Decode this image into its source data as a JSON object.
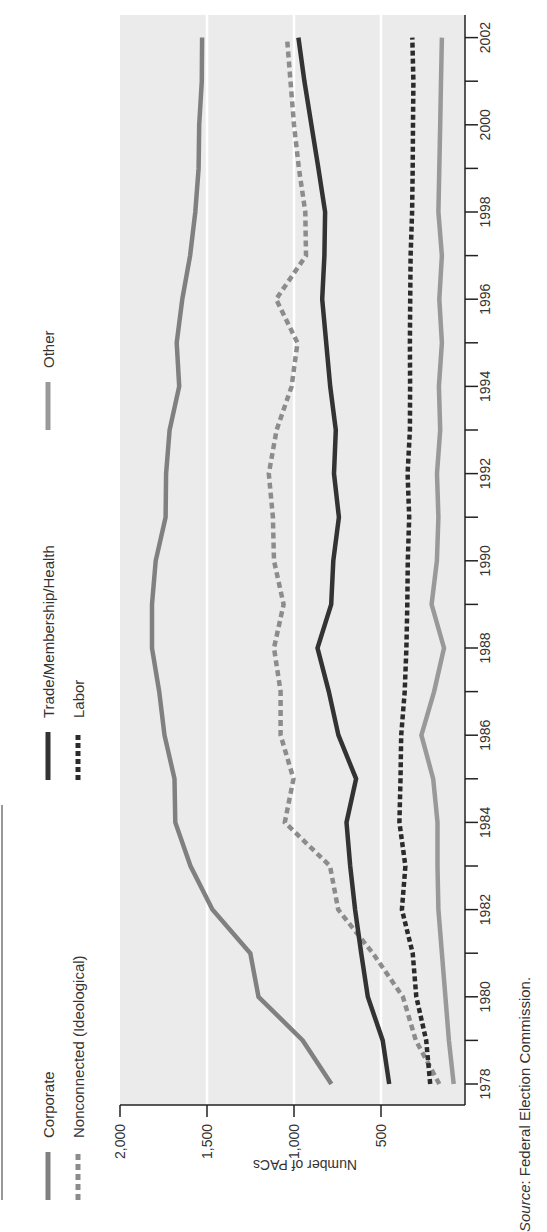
{
  "chart_data": {
    "type": "line",
    "orientation": "rotated-90-clockwise",
    "title": "",
    "xlabel": "",
    "ylabel": "Number of PACs",
    "ylim": [
      0,
      2000
    ],
    "yticks": [
      500,
      1000,
      1500,
      2000
    ],
    "ytick_labels": [
      "500",
      "1,000",
      "1,500",
      "2,000"
    ],
    "x": [
      1978,
      1979,
      1980,
      1981,
      1982,
      1983,
      1984,
      1985,
      1986,
      1987,
      1988,
      1989,
      1990,
      1991,
      1992,
      1993,
      1994,
      1995,
      1996,
      1997,
      1998,
      1999,
      2000,
      2001,
      2002
    ],
    "xticks": [
      1978,
      1980,
      1982,
      1984,
      1986,
      1988,
      1990,
      1992,
      1994,
      1996,
      1998,
      2000,
      2002
    ],
    "xtick_labels": [
      "1978",
      "1980",
      "1982",
      "1984",
      "1986",
      "1988",
      "1990",
      "1992",
      "1994",
      "1996",
      "1998",
      "2000",
      "2002"
    ],
    "grid": true,
    "legend_position": "top",
    "series": [
      {
        "name": "Corporate",
        "style": "solid",
        "color": "#808080",
        "values": [
          785,
          950,
          1204,
          1251,
          1469,
          1595,
          1682,
          1687,
          1744,
          1775,
          1816,
          1816,
          1795,
          1738,
          1735,
          1715,
          1660,
          1674,
          1642,
          1597,
          1567,
          1548,
          1545,
          1530,
          1528
        ]
      },
      {
        "name": "Nonconnected (Ideological)",
        "style": "dashed",
        "color": "#8c8c8c",
        "values": [
          165,
          300,
          374,
          547,
          746,
          793,
          1053,
          1003,
          1077,
          1077,
          1115,
          1060,
          1115,
          1121,
          1145,
          1100,
          1014,
          980,
          1103,
          931,
          935,
          972,
          1000,
          1020,
          1040
        ]
      },
      {
        "name": "Trade/Membership/Health",
        "style": "solid",
        "color": "#333333",
        "values": [
          453,
          490,
          576,
          614,
          649,
          677,
          698,
          643,
          745,
          800,
          865,
          786,
          774,
          742,
          770,
          760,
          792,
          815,
          838,
          825,
          821,
          860,
          900,
          940,
          975
        ]
      },
      {
        "name": "Labor",
        "style": "dotted-thick",
        "color": "#2b2b2b",
        "values": [
          217,
          240,
          297,
          318,
          380,
          360,
          394,
          388,
          384,
          364,
          354,
          349,
          346,
          338,
          347,
          334,
          333,
          334,
          332,
          330,
          321,
          318,
          316,
          314,
          320
        ]
      },
      {
        "name": "Other",
        "style": "solid",
        "color": "#999999",
        "values": [
          82,
          110,
          130,
          150,
          170,
          175,
          175,
          200,
          268,
          195,
          138,
          209,
          179,
          170,
          178,
          160,
          167,
          150,
          165,
          150,
          170,
          165,
          160,
          155,
          150
        ]
      }
    ]
  },
  "legend": {
    "items": [
      {
        "label": "Corporate"
      },
      {
        "label": "Nonconnected (Ideological)"
      },
      {
        "label": "Trade/Membership/Health"
      },
      {
        "label": "Labor"
      },
      {
        "label": "Other"
      }
    ]
  },
  "axis": {
    "y_title": "Number of PACs",
    "y_tick_labels": [
      "2,000",
      "1,500",
      "1,000",
      "500"
    ],
    "x_tick_labels": [
      "1978",
      "1980",
      "1982",
      "1984",
      "1986",
      "1988",
      "1990",
      "1992",
      "1994",
      "1996",
      "1998",
      "2000",
      "2002"
    ]
  },
  "source": {
    "prefix": "Source",
    "text": ": Federal Election Commission."
  },
  "colors": {
    "plot_background": "#ebebeb",
    "gridline": "#ffffff",
    "corporate": "#808080",
    "nonconnected": "#8c8c8c",
    "trade": "#333333",
    "labor": "#2b2b2b",
    "other": "#999999"
  }
}
